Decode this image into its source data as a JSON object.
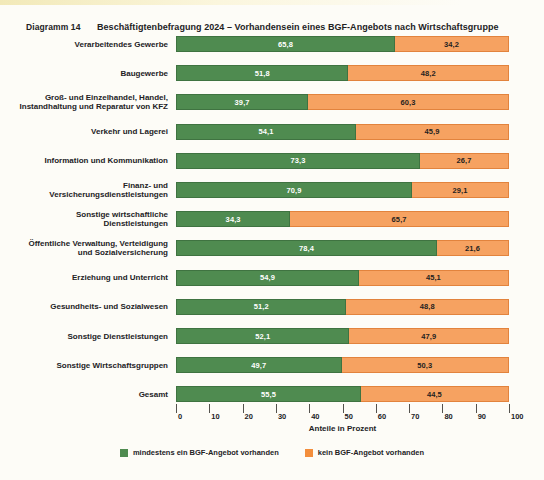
{
  "figure": {
    "number_label": "Diagramm 14",
    "title": "Beschäftigtenbefragung 2024 – Vorhandensein eines BGF-Angebots nach Wirtschaftsgruppe"
  },
  "colors": {
    "green": "#4f8b50",
    "orange": "#f6a261",
    "legend_orange": "#f38e3c",
    "background": "#fdfcf7",
    "text": "#23221f"
  },
  "legend": {
    "items": [
      {
        "label": "mindestens ein BGF-Angebot vorhanden",
        "color": "#4f8b50",
        "swatch": "green"
      },
      {
        "label": "kein BGF-Angebot vorhanden",
        "color": "#f38e3c",
        "swatch": "orange"
      }
    ]
  },
  "axis": {
    "title": "Anteile in Prozent",
    "ticks": [
      "0",
      "10",
      "20",
      "30",
      "40",
      "50",
      "60",
      "70",
      "80",
      "90",
      "100"
    ],
    "min": 0,
    "max": 100
  },
  "chart_data": {
    "type": "bar",
    "orientation": "horizontal",
    "stacked": true,
    "stacked_percent": true,
    "title": "Beschäftigtenbefragung 2024 – Vorhandensein eines BGF-Angebots nach Wirtschaftsgruppe",
    "xlabel": "Anteile in Prozent",
    "ylabel": "",
    "xlim": [
      0,
      100
    ],
    "grid": false,
    "legend_position": "bottom-center",
    "categories": [
      "Verarbeitendes Gewerbe",
      "Baugewerbe",
      "Groß- und Einzelhandel, Handel, Instandhaltung und Reparatur von KFZ",
      "Verkehr und Lagerei",
      "Information und Kommunikation",
      "Finanz- und Versicherungsdienstleistungen",
      "Sonstige wirtschaftliche Dienstleistungen",
      "Öffentliche Verwaltung, Verteidigung und Sozialversicherung",
      "Erziehung und Unterricht",
      "Gesundheits- und Sozialwesen",
      "Sonstige Dienstleistungen",
      "Sonstige Wirtschaftsgruppen",
      "Gesamt"
    ],
    "series": [
      {
        "name": "mindestens ein BGF-Angebot vorhanden",
        "color": "#4f8b50",
        "values": [
          65.8,
          51.8,
          39.7,
          54.1,
          73.3,
          70.9,
          34.3,
          78.4,
          54.9,
          51.2,
          52.1,
          49.7,
          55.5
        ],
        "labels": [
          "65,8",
          "51,8",
          "39,7",
          "54,1",
          "73,3",
          "70,9",
          "34,3",
          "78,4",
          "54,9",
          "51,2",
          "52,1",
          "49,7",
          "55,5"
        ]
      },
      {
        "name": "kein BGF-Angebot vorhanden",
        "color": "#f6a261",
        "values": [
          34.2,
          48.2,
          60.3,
          45.9,
          26.7,
          29.1,
          65.7,
          21.6,
          45.1,
          48.8,
          47.9,
          50.3,
          44.5
        ],
        "labels": [
          "34,2",
          "48,2",
          "60,3",
          "45,9",
          "26,7",
          "29,1",
          "65,7",
          "21,6",
          "45,1",
          "48,8",
          "47,9",
          "50,3",
          "44,5"
        ]
      }
    ]
  },
  "rows": [
    {
      "lines": [
        "Verarbeitendes Gewerbe"
      ],
      "green": 65.8,
      "orange": 34.2,
      "green_label": "65,8",
      "orange_label": "34,2"
    },
    {
      "lines": [
        "Baugewerbe"
      ],
      "green": 51.8,
      "orange": 48.2,
      "green_label": "51,8",
      "orange_label": "48,2"
    },
    {
      "lines": [
        "Groß- und Einzelhandel, Handel,",
        "Instandhaltung und Reparatur von KFZ"
      ],
      "green": 39.7,
      "orange": 60.3,
      "green_label": "39,7",
      "orange_label": "60,3"
    },
    {
      "lines": [
        "Verkehr und Lagerei"
      ],
      "green": 54.1,
      "orange": 45.9,
      "green_label": "54,1",
      "orange_label": "45,9"
    },
    {
      "lines": [
        "Information und Kommunikation"
      ],
      "green": 73.3,
      "orange": 26.7,
      "green_label": "73,3",
      "orange_label": "26,7"
    },
    {
      "lines": [
        "Finanz- und",
        "Versicherungsdienstleistungen"
      ],
      "green": 70.9,
      "orange": 29.1,
      "green_label": "70,9",
      "orange_label": "29,1"
    },
    {
      "lines": [
        "Sonstige wirtschaftliche",
        "Dienstleistungen"
      ],
      "green": 34.3,
      "orange": 65.7,
      "green_label": "34,3",
      "orange_label": "65,7"
    },
    {
      "lines": [
        "Öffentliche Verwaltung, Verteidigung",
        "und Sozialversicherung"
      ],
      "green": 78.4,
      "orange": 21.6,
      "green_label": "78,4",
      "orange_label": "21,6"
    },
    {
      "lines": [
        "Erziehung und Unterricht"
      ],
      "green": 54.9,
      "orange": 45.1,
      "green_label": "54,9",
      "orange_label": "45,1"
    },
    {
      "lines": [
        "Gesundheits- und Sozialwesen"
      ],
      "green": 51.2,
      "orange": 48.8,
      "green_label": "51,2",
      "orange_label": "48,8"
    },
    {
      "lines": [
        "Sonstige Dienstleistungen"
      ],
      "green": 52.1,
      "orange": 47.9,
      "green_label": "52,1",
      "orange_label": "47,9"
    },
    {
      "lines": [
        "Sonstige Wirtschaftsgruppen"
      ],
      "green": 49.7,
      "orange": 50.3,
      "green_label": "49,7",
      "orange_label": "50,3"
    },
    {
      "lines": [
        "Gesamt"
      ],
      "green": 55.5,
      "orange": 44.5,
      "green_label": "55,5",
      "orange_label": "44,5"
    }
  ]
}
